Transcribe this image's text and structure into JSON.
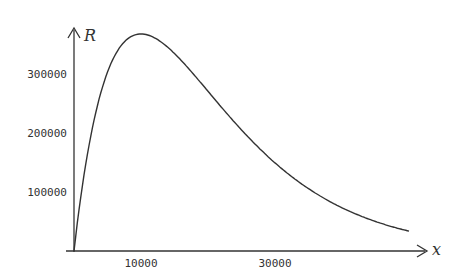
{
  "chart_data": {
    "type": "line",
    "title": "",
    "xlabel": "x",
    "ylabel": "R",
    "x_ticks": [
      10000,
      30000
    ],
    "x_tick_labels": [
      "10000",
      "30000"
    ],
    "y_ticks": [
      100000,
      200000,
      300000
    ],
    "y_tick_labels": [
      "100000",
      "200000",
      "300000"
    ],
    "xlim": [
      0,
      52000
    ],
    "ylim": [
      0,
      380000
    ],
    "grid": false,
    "legend": null,
    "series": [
      {
        "name": "R",
        "x": [
          0,
          1000,
          2500,
          5000,
          7500,
          10000,
          12500,
          15000,
          20000,
          25000,
          30000,
          35000,
          40000,
          45000,
          50000
        ],
        "values": [
          0,
          90484,
          194700,
          303265,
          354275,
          367879,
          358131,
          334695,
          270671,
          205212,
          149361,
          105691,
          73263,
          49990,
          33690
        ]
      }
    ],
    "colors": {
      "line": "#333333",
      "axis": "#333333"
    }
  }
}
